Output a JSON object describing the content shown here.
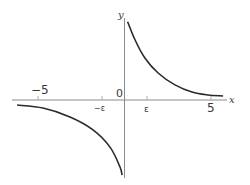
{
  "chart_data": {
    "type": "line",
    "title": "",
    "xlabel": "x",
    "ylabel": "y",
    "origin_label": "0",
    "xlim": [
      -7.0,
      7.2
    ],
    "ylim": [
      -4.4,
      5.8
    ],
    "grid": false,
    "legend": null,
    "x_ticks": [
      {
        "value": -5,
        "label": "−5",
        "label_pos": "above"
      },
      {
        "value": -1.3,
        "label": "−ε",
        "label_pos": "below"
      },
      {
        "value": 1.3,
        "label": "ε",
        "label_pos": "below"
      },
      {
        "value": 5,
        "label": "5",
        "label_pos": "below"
      }
    ],
    "series": [
      {
        "name": "upper-branch (x > 0)",
        "color": "#2a2a2a",
        "x": [
          0.18,
          0.61,
          1.18,
          1.94,
          2.92,
          3.9,
          4.83,
          5.7
        ],
        "y": [
          4.52,
          3.47,
          2.43,
          1.56,
          0.87,
          0.46,
          0.29,
          0.23
        ]
      },
      {
        "name": "lower-branch (x < 0)",
        "color": "#2a2a2a",
        "x": [
          -6.21,
          -4.71,
          -3.15,
          -1.82,
          -0.84,
          -0.26,
          -0.14
        ],
        "y": [
          -0.29,
          -0.46,
          -0.98,
          -1.73,
          -2.72,
          -3.87,
          -4.34
        ]
      }
    ]
  },
  "labels": {
    "x_axis": "x",
    "y_axis": "y",
    "origin": "0",
    "neg5": "−5",
    "neg_eps": "−ε",
    "eps": "ε",
    "pos5": "5"
  }
}
